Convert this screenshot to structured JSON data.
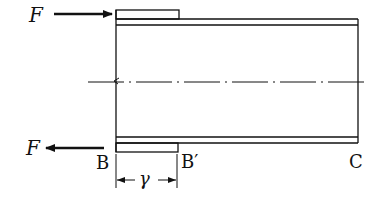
{
  "diagram": {
    "type": "mechanics-figure",
    "labels": {
      "force_top": "F",
      "force_bottom": "F",
      "point_b": "B",
      "point_b_prime": "B′",
      "point_c": "C",
      "dimension": "γ"
    },
    "colors": {
      "line": "#111111",
      "background": "#ffffff"
    },
    "elements": [
      {
        "id": "top-force-arrow",
        "direction": "right",
        "label": "F"
      },
      {
        "id": "bottom-force-arrow",
        "direction": "left",
        "label": "F"
      },
      {
        "id": "tube",
        "from": "B",
        "to": "C"
      },
      {
        "id": "sleeve",
        "from": "B",
        "to": "B′"
      },
      {
        "id": "centerline",
        "style": "dash-dot"
      },
      {
        "id": "dimension-r",
        "from": "B",
        "to": "B′",
        "label": "γ"
      }
    ]
  }
}
